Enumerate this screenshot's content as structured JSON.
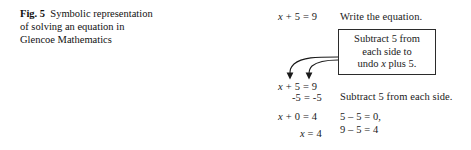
{
  "caption": {
    "label": "Fig. 5",
    "text": "Symbolic representation of solving an equation in Glencoe Mathematics"
  },
  "diagram": {
    "equations": {
      "top": "x + 5 = 9",
      "restate": "x + 5 = 9",
      "subtract": "-5 = -5",
      "zero": "x + 0 = 4",
      "solution": "x = 4"
    },
    "annotations": {
      "write": "Write the equation.",
      "subtract": "Subtract 5 from each side.",
      "calc_line1": "5 – 5 = 0,",
      "calc_line2": "9 – 5 = 4"
    },
    "callout": {
      "line1": "Subtract 5 from",
      "line2": "each side to",
      "line3": "undo x plus 5."
    },
    "arrows": {
      "count": 2,
      "description": "curved-arrow-from-callout-to-equation-terms",
      "color": "#1a1a1a"
    }
  },
  "colors": {
    "background": "#ffffff",
    "text": "#1a1a1a",
    "box_border": "#2b2b2b"
  }
}
